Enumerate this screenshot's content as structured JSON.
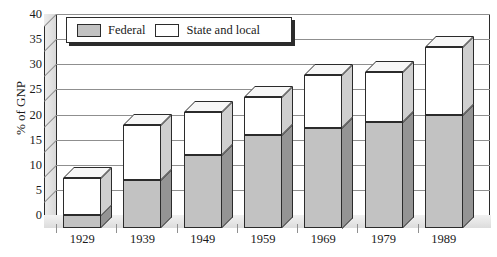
{
  "chart_data": {
    "type": "bar",
    "stacked": true,
    "title": "",
    "xlabel": "",
    "ylabel": "% of GNP",
    "ylim": [
      0,
      40
    ],
    "ytick_step": 5,
    "yticks": [
      "40",
      "35",
      "30",
      "25",
      "20",
      "15",
      "10",
      "5",
      "0"
    ],
    "grid": true,
    "legend_position": "top-left-inside",
    "categories": [
      "1929",
      "1939",
      "1949",
      "1959",
      "1969",
      "1979",
      "1989"
    ],
    "series": [
      {
        "name": "Federal",
        "color": "#c2c2c2",
        "values": [
          2.5,
          9.5,
          14.5,
          18.5,
          20.0,
          21.0,
          22.5
        ]
      },
      {
        "name": "State and local",
        "color": "#ffffff",
        "values": [
          7.5,
          11.0,
          8.5,
          7.5,
          10.5,
          10.0,
          13.5
        ]
      }
    ],
    "totals": [
      10.0,
      20.5,
      23.0,
      26.0,
      30.5,
      31.0,
      36.0
    ]
  },
  "legend": {
    "items": [
      {
        "label": "Federal",
        "swatch": "federal-swatch"
      },
      {
        "label": "State and local",
        "swatch": "state-local-swatch"
      }
    ]
  },
  "axes": {
    "y_title": "% of GNP"
  },
  "colors": {
    "federal_fill": "#c2c2c2",
    "state_fill": "#ffffff",
    "bar_side_federal": "#949494",
    "bar_side_state": "#cfcfcf",
    "bar_top": "#f7f7f7",
    "outline": "#2b2b2b",
    "gridline": "#8f8f8f",
    "wall": "#e2e2e2",
    "background": "#ffffff"
  }
}
